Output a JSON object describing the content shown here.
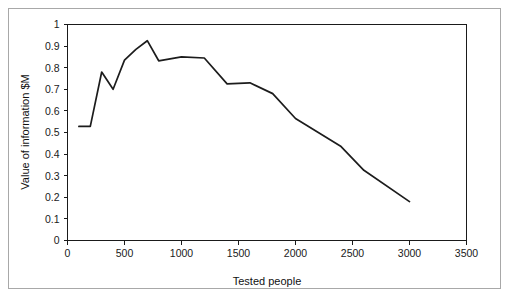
{
  "figure": {
    "frame_color": "#a8a8a8",
    "background_color": "#ffffff",
    "line_color": "#1c1c1c"
  },
  "axes": {
    "x_title": "Tested people",
    "y_title": "Value of information $M",
    "x_ticks": [
      "0",
      "500",
      "1000",
      "1500",
      "2000",
      "2500",
      "3000",
      "3500"
    ],
    "y_ticks": [
      "0",
      "0.1",
      "0.2",
      "0.3",
      "0.4",
      "0.5",
      "0.6",
      "0.7",
      "0.8",
      "0.9",
      "1"
    ]
  },
  "chart_data": {
    "type": "line",
    "title": "",
    "xlabel": "Tested people",
    "ylabel": "Value of information $M",
    "xlim": [
      0,
      3500
    ],
    "ylim": [
      0,
      1
    ],
    "xticks": [
      0,
      500,
      1000,
      1500,
      2000,
      2500,
      3000,
      3500
    ],
    "yticks": [
      0,
      0.1,
      0.2,
      0.3,
      0.4,
      0.5,
      0.6,
      0.7,
      0.8,
      0.9,
      1
    ],
    "grid": false,
    "legend": false,
    "legend_position": "none",
    "series": [
      {
        "name": "Value of information",
        "color": "#1c1c1c",
        "x": [
          100,
          200,
          300,
          400,
          500,
          600,
          700,
          800,
          1000,
          1200,
          1400,
          1600,
          1800,
          2000,
          2200,
          2400,
          2600,
          3000
        ],
        "y": [
          0.528,
          0.528,
          0.78,
          0.7,
          0.835,
          0.885,
          0.925,
          0.832,
          0.85,
          0.845,
          0.725,
          0.73,
          0.68,
          0.565,
          0.5,
          0.435,
          0.325,
          0.18
        ]
      }
    ]
  }
}
